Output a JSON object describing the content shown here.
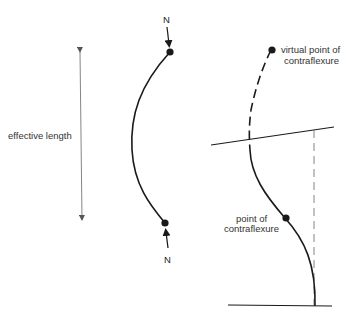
{
  "diagram": {
    "colors": {
      "ink": "#1a1a1a",
      "dim_line": "#777777",
      "background": "#ffffff"
    },
    "left_figure": {
      "dimension_label": "effective length",
      "load_top_label": "N",
      "load_bottom_label": "N",
      "description": "pin-ended strut bowed under axial load N"
    },
    "right_figure": {
      "virtual_point_label_line1": "virtual point of",
      "virtual_point_label_line2": "contraflexure",
      "point_label_line1": "point of",
      "point_label_line2": "contraflexure",
      "description": "strut fixed at base and sway-restrained top, showing dashed extension to virtual point of contraflexure"
    }
  }
}
